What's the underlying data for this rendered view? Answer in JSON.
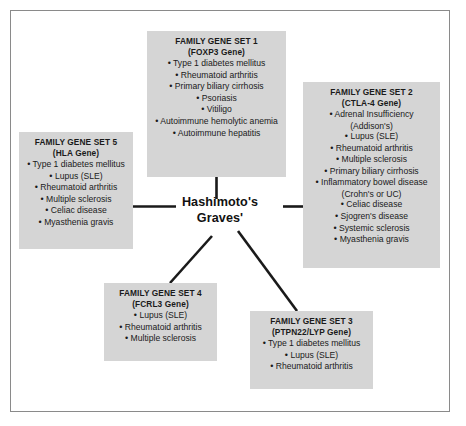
{
  "diagram": {
    "center": {
      "line1": "Hashimoto's",
      "line2": "Graves'"
    },
    "boxes": [
      {
        "id": "set1",
        "title": "FAMILY GENE SET 1",
        "subtitle": "(FOXP3 Gene)",
        "items": [
          "Type 1 diabetes mellitus",
          "Rheumatoid arthritis",
          "Primary biliary cirrhosis",
          "Psoriasis",
          "Vitiligo",
          "Autoimmune hemolytic anemia",
          "Autoimmune hepatitis"
        ]
      },
      {
        "id": "set2",
        "title": "FAMILY GENE SET 2",
        "subtitle": "(CTLA-4 Gene)",
        "items": [
          "Adrenal Insufficiency",
          "Lupus (SLE)",
          "Rheumatoid arthritis",
          "Multiple sclerosis",
          "Primary biliary cirrhosis",
          "Inflammatory bowel disease",
          "Celiac disease",
          "Sjogren's disease",
          "Systemic sclerosis",
          "Myasthenia gravis"
        ],
        "item_sublines": {
          "0": "(Addison's)",
          "5": "(Crohn's or UC)"
        }
      },
      {
        "id": "set3",
        "title": "FAMILY GENE SET 3",
        "subtitle": "(PTPN22/LYP Gene)",
        "items": [
          "Type 1 diabetes mellitus",
          "Lupus (SLE)",
          "Rheumatoid arthritis"
        ]
      },
      {
        "id": "set4",
        "title": "FAMILY GENE SET 4",
        "subtitle": "(FCRL3 Gene)",
        "items": [
          "Lupus (SLE)",
          "Rheumatoid arthritis",
          "Multiple sclerosis"
        ]
      },
      {
        "id": "set5",
        "title": "FAMILY GENE SET 5",
        "subtitle": "(HLA Gene)",
        "items": [
          "Type 1 diabetes mellitus",
          "Lupus (SLE)",
          "Rheumatoid arthritis",
          "Multiple sclerosis",
          "Celiac disease",
          "Myasthenia gravis"
        ]
      }
    ],
    "colors": {
      "box_fill": "#d5d5d5",
      "frame_border": "#8a8a8a",
      "connector": "#1a1a1a",
      "text": "#1a1a1a",
      "background": "#ffffff"
    }
  }
}
